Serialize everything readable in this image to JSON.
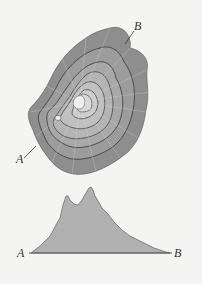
{
  "map": {
    "label_a": "A",
    "label_b": "B",
    "colors": {
      "outer": "#8e8e8e",
      "ring2": "#9c9c9c",
      "ring3": "#a8a8a8",
      "ring4": "#b4b4b4",
      "ring5": "#c0c0c0",
      "ring6": "#cccccc",
      "ring7": "#d8d8d8",
      "summit": "#f4f4f4",
      "contour_line": "#4a4a4a",
      "radial_line": "#b8b8b8"
    }
  },
  "profile": {
    "label_a": "A",
    "label_b": "B",
    "fill": "#b0b0b0",
    "stroke": "#6e6e6e"
  }
}
